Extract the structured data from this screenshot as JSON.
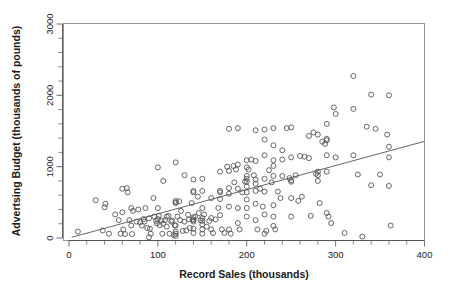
{
  "chart_data": {
    "type": "scatter",
    "title": "",
    "xlabel": "Record Sales (thousands)",
    "ylabel": "Advertsing Budget (thousands of pounds)",
    "xlim": [
      0,
      400
    ],
    "ylim": [
      0,
      3000
    ],
    "xticks": [
      0,
      100,
      200,
      300,
      400
    ],
    "yticks": [
      0,
      1000,
      2000,
      3000
    ],
    "xtick_labels": [
      "0",
      "100",
      "200",
      "300",
      "400"
    ],
    "ytick_labels": [
      "0",
      "1000",
      "2000",
      "3000"
    ],
    "minor_tick_interval_x": 20,
    "minor_tick_interval_y": 200,
    "grid": false,
    "legend": null,
    "marker": "open-circle",
    "marker_size_px": 5,
    "marker_color": "#555555",
    "n_points": 200,
    "trendline": {
      "type": "linear-fit",
      "color": "#555555",
      "x_start": 3,
      "y_start": 10,
      "x_end": 400,
      "y_end": 1355
    },
    "points": [
      [
        10,
        90
      ],
      [
        30,
        530
      ],
      [
        38,
        105
      ],
      [
        40,
        430
      ],
      [
        41,
        480
      ],
      [
        45,
        60
      ],
      [
        52,
        330
      ],
      [
        56,
        250
      ],
      [
        58,
        60
      ],
      [
        60,
        690
      ],
      [
        60,
        360
      ],
      [
        61,
        120
      ],
      [
        63,
        55
      ],
      [
        65,
        700
      ],
      [
        66,
        640
      ],
      [
        68,
        250
      ],
      [
        70,
        420
      ],
      [
        70,
        175
      ],
      [
        71,
        55
      ],
      [
        72,
        380
      ],
      [
        76,
        230
      ],
      [
        78,
        400
      ],
      [
        80,
        220
      ],
      [
        82,
        175
      ],
      [
        84,
        265
      ],
      [
        85,
        230
      ],
      [
        86,
        420
      ],
      [
        88,
        140
      ],
      [
        90,
        10
      ],
      [
        90,
        275
      ],
      [
        91,
        130
      ],
      [
        92,
        60
      ],
      [
        95,
        560
      ],
      [
        96,
        300
      ],
      [
        98,
        240
      ],
      [
        99,
        205
      ],
      [
        100,
        990
      ],
      [
        100,
        420
      ],
      [
        100,
        265
      ],
      [
        101,
        310
      ],
      [
        102,
        180
      ],
      [
        104,
        245
      ],
      [
        105,
        60
      ],
      [
        106,
        800
      ],
      [
        106,
        200
      ],
      [
        108,
        250
      ],
      [
        110,
        300
      ],
      [
        110,
        160
      ],
      [
        112,
        310
      ],
      [
        113,
        60
      ],
      [
        115,
        230
      ],
      [
        116,
        245
      ],
      [
        118,
        40
      ],
      [
        119,
        180
      ],
      [
        120,
        1060
      ],
      [
        120,
        520
      ],
      [
        120,
        500
      ],
      [
        120,
        490
      ],
      [
        120,
        175
      ],
      [
        120,
        90
      ],
      [
        120,
        60
      ],
      [
        120,
        30
      ],
      [
        122,
        300
      ],
      [
        124,
        515
      ],
      [
        125,
        250
      ],
      [
        126,
        380
      ],
      [
        128,
        100
      ],
      [
        130,
        880
      ],
      [
        130,
        230
      ],
      [
        132,
        105
      ],
      [
        134,
        325
      ],
      [
        135,
        260
      ],
      [
        136,
        140
      ],
      [
        138,
        490
      ],
      [
        139,
        260
      ],
      [
        140,
        820
      ],
      [
        140,
        660
      ],
      [
        140,
        640
      ],
      [
        140,
        290
      ],
      [
        140,
        250
      ],
      [
        140,
        230
      ],
      [
        140,
        130
      ],
      [
        140,
        70
      ],
      [
        142,
        300
      ],
      [
        145,
        580
      ],
      [
        146,
        350
      ],
      [
        148,
        250
      ],
      [
        150,
        830
      ],
      [
        150,
        660
      ],
      [
        150,
        420
      ],
      [
        150,
        280
      ],
      [
        150,
        240
      ],
      [
        150,
        190
      ],
      [
        150,
        120
      ],
      [
        150,
        60
      ],
      [
        152,
        330
      ],
      [
        155,
        160
      ],
      [
        158,
        240
      ],
      [
        160,
        560
      ],
      [
        160,
        280
      ],
      [
        160,
        120
      ],
      [
        162,
        70
      ],
      [
        165,
        260
      ],
      [
        168,
        420
      ],
      [
        170,
        930
      ],
      [
        170,
        660
      ],
      [
        170,
        640
      ],
      [
        170,
        545
      ],
      [
        170,
        320
      ],
      [
        172,
        120
      ],
      [
        175,
        70
      ],
      [
        178,
        1000
      ],
      [
        180,
        1530
      ],
      [
        180,
        940
      ],
      [
        180,
        700
      ],
      [
        180,
        620
      ],
      [
        180,
        440
      ],
      [
        180,
        120
      ],
      [
        182,
        60
      ],
      [
        185,
        1010
      ],
      [
        186,
        780
      ],
      [
        188,
        960
      ],
      [
        190,
        1540
      ],
      [
        190,
        1030
      ],
      [
        190,
        690
      ],
      [
        190,
        420
      ],
      [
        190,
        210
      ],
      [
        192,
        120
      ],
      [
        195,
        640
      ],
      [
        198,
        790
      ],
      [
        200,
        1090
      ],
      [
        200,
        990
      ],
      [
        200,
        870
      ],
      [
        200,
        830
      ],
      [
        200,
        790
      ],
      [
        200,
        720
      ],
      [
        200,
        640
      ],
      [
        200,
        540
      ],
      [
        200,
        420
      ],
      [
        200,
        300
      ],
      [
        202,
        960
      ],
      [
        205,
        1100
      ],
      [
        208,
        880
      ],
      [
        210,
        1510
      ],
      [
        210,
        1080
      ],
      [
        210,
        820
      ],
      [
        210,
        760
      ],
      [
        210,
        660
      ],
      [
        210,
        480
      ],
      [
        210,
        250
      ],
      [
        212,
        120
      ],
      [
        215,
        690
      ],
      [
        218,
        440
      ],
      [
        220,
        1520
      ],
      [
        220,
        1380
      ],
      [
        220,
        1160
      ],
      [
        220,
        830
      ],
      [
        220,
        650
      ],
      [
        220,
        330
      ],
      [
        220,
        60
      ],
      [
        222,
        100
      ],
      [
        225,
        950
      ],
      [
        228,
        780
      ],
      [
        230,
        1540
      ],
      [
        230,
        1300
      ],
      [
        230,
        1090
      ],
      [
        230,
        1010
      ],
      [
        230,
        870
      ],
      [
        230,
        460
      ],
      [
        230,
        300
      ],
      [
        230,
        170
      ],
      [
        232,
        120
      ],
      [
        235,
        650
      ],
      [
        238,
        560
      ],
      [
        240,
        1230
      ],
      [
        240,
        1100
      ],
      [
        240,
        870
      ],
      [
        245,
        1540
      ],
      [
        248,
        840
      ],
      [
        250,
        1550
      ],
      [
        250,
        1130
      ],
      [
        250,
        810
      ],
      [
        250,
        790
      ],
      [
        250,
        560
      ],
      [
        250,
        300
      ],
      [
        255,
        880
      ],
      [
        258,
        520
      ],
      [
        260,
        1150
      ],
      [
        262,
        580
      ],
      [
        265,
        1140
      ],
      [
        270,
        1430
      ],
      [
        270,
        1120
      ],
      [
        272,
        310
      ],
      [
        275,
        1480
      ],
      [
        278,
        900
      ],
      [
        280,
        1450
      ],
      [
        280,
        930
      ],
      [
        280,
        880
      ],
      [
        280,
        800
      ],
      [
        282,
        490
      ],
      [
        285,
        1350
      ],
      [
        288,
        1320
      ],
      [
        290,
        1600
      ],
      [
        290,
        1390
      ],
      [
        290,
        1370
      ],
      [
        290,
        1160
      ],
      [
        290,
        930
      ],
      [
        290,
        350
      ],
      [
        292,
        300
      ],
      [
        295,
        210
      ],
      [
        298,
        1830
      ],
      [
        300,
        1740
      ],
      [
        300,
        1130
      ],
      [
        310,
        70
      ],
      [
        320,
        2270
      ],
      [
        320,
        1810
      ],
      [
        320,
        1160
      ],
      [
        325,
        890
      ],
      [
        330,
        20
      ],
      [
        335,
        1560
      ],
      [
        340,
        2010
      ],
      [
        340,
        740
      ],
      [
        345,
        1530
      ],
      [
        350,
        890
      ],
      [
        358,
        1450
      ],
      [
        360,
        2000
      ],
      [
        360,
        1280
      ],
      [
        360,
        1130
      ],
      [
        360,
        730
      ],
      [
        362,
        175
      ]
    ]
  }
}
